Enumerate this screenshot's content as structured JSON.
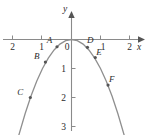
{
  "figure": {
    "title": "",
    "axis_labels": {
      "x": "x",
      "y": "y"
    },
    "colors": {
      "curve": "#8f8f8f",
      "axis": "#8a8a8a",
      "point": "#555555",
      "text": "#2b2b2b",
      "background": "#ffffff"
    }
  },
  "chart_data": {
    "type": "line",
    "title": "",
    "xlabel": "x",
    "ylabel": "y",
    "xlim": [
      -2.45,
      2.45
    ],
    "ylim": [
      -3.4,
      0.45
    ],
    "grid": false,
    "legend": null,
    "function": "y = -x^2",
    "x_ticks": [
      {
        "value": -2,
        "label": "2"
      },
      {
        "value": -1,
        "label": "1"
      },
      {
        "value": 0,
        "label": "0"
      },
      {
        "value": 1,
        "label": "1"
      },
      {
        "value": 2,
        "label": "2"
      }
    ],
    "y_ticks": [
      {
        "value": -1,
        "label": "1"
      },
      {
        "value": -2,
        "label": "2"
      },
      {
        "value": -3,
        "label": "3"
      }
    ],
    "origin_label": "0",
    "series": [
      {
        "name": "parabola",
        "x": [
          -1.82,
          -1.6,
          -1.4,
          -1.2,
          -1.0,
          -0.8,
          -0.6,
          -0.4,
          -0.2,
          0,
          0.2,
          0.4,
          0.6,
          0.8,
          1.0,
          1.2,
          1.4,
          1.6,
          1.82
        ],
        "values": [
          -3.31,
          -2.56,
          -1.96,
          -1.44,
          -1.0,
          -0.64,
          -0.36,
          -0.16,
          -0.04,
          0,
          -0.04,
          -0.16,
          -0.36,
          -0.64,
          -1.0,
          -1.44,
          -1.96,
          -2.56,
          -3.31
        ]
      }
    ],
    "annotations": [
      {
        "label": "A",
        "x": -0.5,
        "y": -0.25,
        "label_dx": -0.26,
        "label_dy": 0.12
      },
      {
        "label": "B",
        "x": -0.9,
        "y": -0.78,
        "label_dx": -0.3,
        "label_dy": 0.1
      },
      {
        "label": "C",
        "x": -1.42,
        "y": -2.0,
        "label_dx": -0.35,
        "label_dy": 0.08
      },
      {
        "label": "D",
        "x": 0.55,
        "y": -0.27,
        "label_dx": 0.1,
        "label_dy": 0.14
      },
      {
        "label": "E",
        "x": 0.82,
        "y": -0.62,
        "label_dx": 0.13,
        "label_dy": 0.07
      },
      {
        "label": "F",
        "x": 1.26,
        "y": -1.57,
        "label_dx": 0.13,
        "label_dy": 0.1
      }
    ]
  }
}
